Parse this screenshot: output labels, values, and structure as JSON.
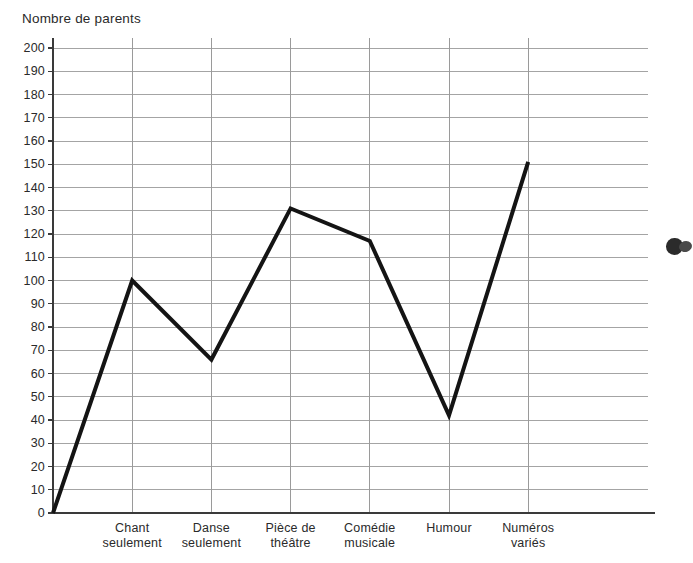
{
  "chart_data": {
    "type": "line",
    "title": "",
    "ylabel": "Nombre de parents",
    "xlabel": "",
    "categories": [
      "Chant\nseulement",
      "Danse\nseulement",
      "Pièce de\nthéâtre",
      "Comédie\nmusicale",
      "Humour",
      "Numéros\nvariés"
    ],
    "values": [
      100,
      66,
      131,
      117,
      42,
      151
    ],
    "starts_at_origin": true,
    "origin_value": 0,
    "ylim": [
      0,
      200
    ],
    "ytick_step": 10,
    "yticks": [
      "200",
      "190",
      "180",
      "170",
      "160",
      "150",
      "140",
      "130",
      "120",
      "110",
      "100",
      "90",
      "80",
      "70",
      "60",
      "50",
      "40",
      "30",
      "20",
      "10",
      "0"
    ],
    "grid": {
      "horizontal": true,
      "vertical": true,
      "color": "#9a9a9a"
    },
    "legend": null,
    "series_color": "#141414",
    "series_width_px": 4
  },
  "annotations": {
    "edge_marker": "bullet-blob"
  },
  "colors": {
    "ink": "#1c1c1c",
    "grid": "#9a9a9a",
    "axis": "#3a3a3a",
    "line": "#141414",
    "paper": "#ffffff"
  }
}
